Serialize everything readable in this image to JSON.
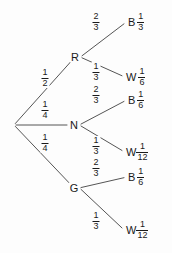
{
  "diagram": {
    "type": "probability-tree",
    "background_color": "#fdfdfd",
    "line_color": "#555555",
    "text_color": "#1a1a1a"
  },
  "root": {
    "label": "",
    "x": 14,
    "y": 125
  },
  "level1": [
    {
      "id": "R",
      "label": "R",
      "x": 75,
      "y": 57,
      "prob_num": "1",
      "prob_den": "2",
      "frac_x": 45,
      "frac_y": 78
    },
    {
      "id": "N",
      "label": "N",
      "x": 74,
      "y": 125,
      "prob_num": "1",
      "prob_den": "4",
      "frac_x": 45,
      "frac_y": 110
    },
    {
      "id": "G",
      "label": "G",
      "x": 74,
      "y": 188,
      "prob_num": "1",
      "prob_den": "4",
      "frac_x": 45,
      "frac_y": 143
    }
  ],
  "level2": [
    {
      "id": "R-B",
      "parent": "R",
      "letter": "B",
      "x": 128,
      "y": 22,
      "prob_num": "2",
      "prob_den": "3",
      "frac_x": 96,
      "frac_y": 22,
      "outcome_num": "1",
      "outcome_den": "3",
      "tight": false
    },
    {
      "id": "R-W",
      "parent": "R",
      "letter": "W",
      "x": 126,
      "y": 77,
      "prob_num": "1",
      "prob_den": "3",
      "frac_x": 96,
      "frac_y": 72,
      "outcome_num": "1",
      "outcome_den": "6",
      "tight": false
    },
    {
      "id": "N-B",
      "parent": "N",
      "letter": "B",
      "x": 128,
      "y": 100,
      "prob_num": "2",
      "prob_den": "3",
      "frac_x": 96,
      "frac_y": 95,
      "outcome_num": "1",
      "outcome_den": "6",
      "tight": false
    },
    {
      "id": "N-W",
      "parent": "N",
      "letter": "W",
      "x": 126,
      "y": 152,
      "prob_num": "1",
      "prob_den": "3",
      "frac_x": 96,
      "frac_y": 146,
      "outcome_num": "1",
      "outcome_den": "12",
      "tight": true
    },
    {
      "id": "G-B",
      "parent": "G",
      "letter": "B",
      "x": 128,
      "y": 177,
      "prob_num": "2",
      "prob_den": "3",
      "frac_x": 96,
      "frac_y": 168,
      "outcome_num": "1",
      "outcome_den": "6",
      "tight": false
    },
    {
      "id": "G-W",
      "parent": "G",
      "letter": "W",
      "x": 126,
      "y": 230,
      "prob_num": "1",
      "prob_den": "3",
      "frac_x": 96,
      "frac_y": 221,
      "outcome_num": "1",
      "outcome_den": "12",
      "tight": true
    }
  ],
  "chart_data": {
    "type": "tree",
    "root_branches": [
      {
        "label": "R",
        "probability": "1/2"
      },
      {
        "label": "N",
        "probability": "1/4"
      },
      {
        "label": "G",
        "probability": "1/4"
      }
    ],
    "paths": [
      {
        "first": "R",
        "first_prob": "1/2",
        "second": "B",
        "second_prob": "2/3",
        "joint": "1/3"
      },
      {
        "first": "R",
        "first_prob": "1/2",
        "second": "W",
        "second_prob": "1/3",
        "joint": "1/6"
      },
      {
        "first": "N",
        "first_prob": "1/4",
        "second": "B",
        "second_prob": "2/3",
        "joint": "1/6"
      },
      {
        "first": "N",
        "first_prob": "1/4",
        "second": "W",
        "second_prob": "1/3",
        "joint": "1/12"
      },
      {
        "first": "G",
        "first_prob": "1/4",
        "second": "B",
        "second_prob": "2/3",
        "joint": "1/6"
      },
      {
        "first": "G",
        "first_prob": "1/4",
        "second": "W",
        "second_prob": "1/3",
        "joint": "1/12"
      }
    ]
  }
}
